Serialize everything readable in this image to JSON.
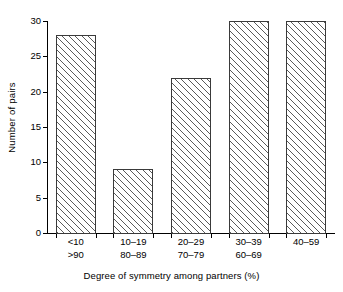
{
  "chart_data": {
    "type": "bar",
    "title": "",
    "subtitle": "",
    "xlabel": "Degree of symmetry among partners (%)",
    "ylabel": "Number of pairs",
    "categories": [
      "<10",
      "10–19",
      "20–29",
      "30–39",
      "40–59"
    ],
    "categories_line2": [
      ">90",
      "80–89",
      "70–79",
      "60–69",
      ""
    ],
    "values": [
      28,
      9,
      22,
      30,
      30
    ],
    "ylim": [
      0,
      30
    ],
    "yticks": [
      0,
      5,
      10,
      15,
      20,
      25,
      30
    ],
    "ytick_labels": [
      "0",
      "5",
      "10",
      "15",
      "20",
      "25",
      "30"
    ],
    "grid": false,
    "legend": null,
    "bar_fill": "#ffffff",
    "bar_edge": "#3a3a3a",
    "hatch": "diagonal-45",
    "axis_color": "#000000",
    "background": "#ffffff"
  }
}
